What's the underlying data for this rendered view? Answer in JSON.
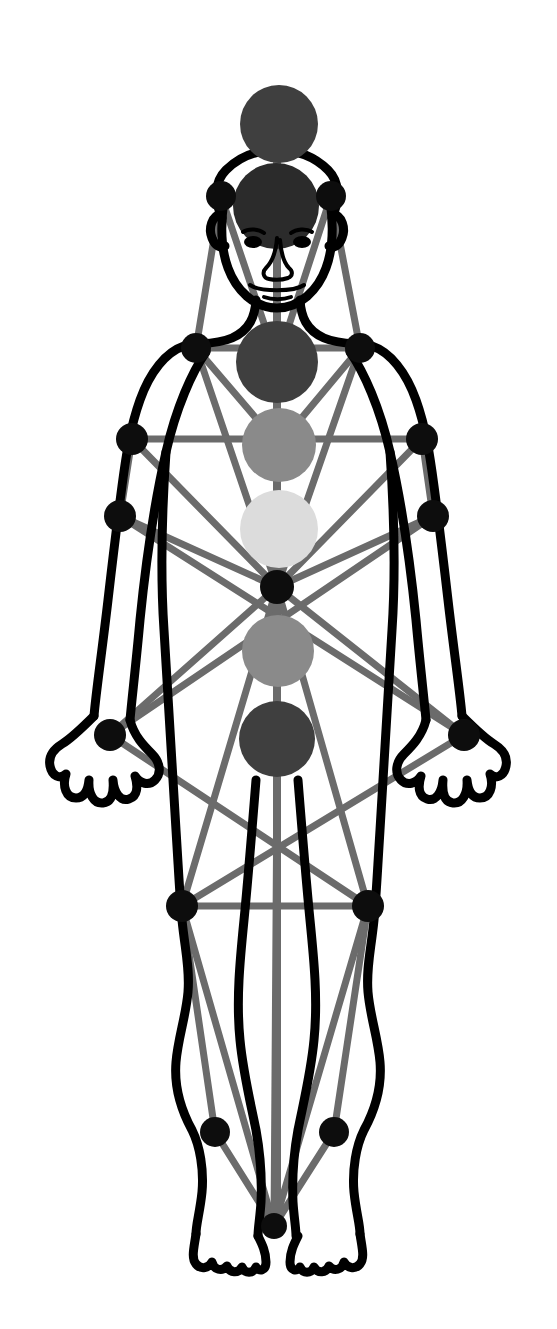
{
  "diagram": {
    "title": "Tree of Life overlaid on human body",
    "type": "anatomical-overlay-diagram",
    "canvas": {
      "width": 557,
      "height": 1329
    },
    "background_color": "#ffffff",
    "body_outline_color": "#000000",
    "path_color": "#6b6b6b",
    "node_color": "#0d0d0d"
  },
  "palette": {
    "body_stroke": "#000000",
    "connector": "#6b6b6b",
    "connector_light": "#7d7d7d",
    "node_black": "#0d0d0d",
    "circle_dark": "#3f3f3f",
    "circle_darker": "#2b2b2b",
    "circle_mid": "#8a8a8a",
    "circle_light": "#dcdcdc",
    "white": "#ffffff"
  },
  "center_circles": [
    {
      "name": "crown-circle",
      "label": "Crown",
      "cx": 279,
      "cy": 124,
      "r": 39,
      "color": "#3f3f3f"
    },
    {
      "name": "head-circle",
      "label": "Head",
      "cx": 276,
      "cy": 206,
      "r": 43,
      "color": "#2b2b2b"
    },
    {
      "name": "throat-chest-circle",
      "label": "Throat/Chest",
      "cx": 277,
      "cy": 362,
      "r": 41,
      "color": "#3f3f3f"
    },
    {
      "name": "heart-circle",
      "label": "Heart",
      "cx": 279,
      "cy": 445,
      "r": 37,
      "color": "#8a8a8a"
    },
    {
      "name": "solar-plexus-circle",
      "label": "Solar Plexus",
      "cx": 279,
      "cy": 529,
      "r": 39,
      "color": "#dcdcdc"
    },
    {
      "name": "sacral-circle",
      "label": "Sacral",
      "cx": 278,
      "cy": 651,
      "r": 36,
      "color": "#8a8a8a"
    },
    {
      "name": "root-circle",
      "label": "Root",
      "cx": 277,
      "cy": 739,
      "r": 38,
      "color": "#3f3f3f"
    }
  ],
  "nodes": [
    {
      "name": "node-temple-left",
      "label": "Left Temple",
      "cx": 221,
      "cy": 196,
      "r": 15
    },
    {
      "name": "node-temple-right",
      "label": "Right Temple",
      "cx": 331,
      "cy": 196,
      "r": 15
    },
    {
      "name": "node-shoulder-left",
      "label": "Left Shoulder",
      "cx": 196,
      "cy": 348,
      "r": 15
    },
    {
      "name": "node-shoulder-right",
      "label": "Right Shoulder",
      "cx": 360,
      "cy": 348,
      "r": 15
    },
    {
      "name": "node-elbow-left",
      "label": "Left Elbow",
      "cx": 132,
      "cy": 439,
      "r": 16
    },
    {
      "name": "node-elbow-right",
      "label": "Right Elbow",
      "cx": 422,
      "cy": 439,
      "r": 16
    },
    {
      "name": "node-forearm-left",
      "label": "Left Forearm",
      "cx": 120,
      "cy": 516,
      "r": 16
    },
    {
      "name": "node-forearm-right",
      "label": "Right Forearm",
      "cx": 433,
      "cy": 516,
      "r": 16
    },
    {
      "name": "node-center",
      "label": "Center",
      "cx": 277,
      "cy": 587,
      "r": 17
    },
    {
      "name": "node-hand-left",
      "label": "Left Hand",
      "cx": 110,
      "cy": 735,
      "r": 16
    },
    {
      "name": "node-hand-right",
      "label": "Right Hand",
      "cx": 464,
      "cy": 735,
      "r": 16
    },
    {
      "name": "node-knee-left",
      "label": "Left Knee",
      "cx": 182,
      "cy": 906,
      "r": 16
    },
    {
      "name": "node-knee-right",
      "label": "Right Knee",
      "cx": 368,
      "cy": 906,
      "r": 16
    },
    {
      "name": "node-ankle-left",
      "label": "Left Ankle",
      "cx": 215,
      "cy": 1132,
      "r": 15
    },
    {
      "name": "node-ankle-right",
      "label": "Right Ankle",
      "cx": 334,
      "cy": 1132,
      "r": 15
    },
    {
      "name": "node-feet",
      "label": "Feet",
      "cx": 274,
      "cy": 1226,
      "r": 13
    }
  ],
  "connectors": [
    {
      "name": "conn-temple-left-to-temple-right",
      "x1": 221,
      "y1": 196,
      "x2": 331,
      "y2": 196
    },
    {
      "name": "conn-temple-left-to-shoulder-left",
      "x1": 221,
      "y1": 196,
      "x2": 196,
      "y2": 348
    },
    {
      "name": "conn-temple-right-to-shoulder-right",
      "x1": 331,
      "y1": 196,
      "x2": 360,
      "y2": 348
    },
    {
      "name": "conn-temple-left-to-head-circle",
      "x1": 221,
      "y1": 196,
      "x2": 277,
      "y2": 362
    },
    {
      "name": "conn-temple-right-to-head-circle",
      "x1": 331,
      "y1": 196,
      "x2": 277,
      "y2": 362
    },
    {
      "name": "conn-shoulder-left-to-shoulder-right",
      "x1": 196,
      "y1": 348,
      "x2": 360,
      "y2": 348
    },
    {
      "name": "conn-shoulder-left-to-heart",
      "x1": 196,
      "y1": 348,
      "x2": 279,
      "y2": 445
    },
    {
      "name": "conn-shoulder-right-to-heart",
      "x1": 360,
      "y1": 348,
      "x2": 279,
      "y2": 445
    },
    {
      "name": "conn-shoulder-left-to-center",
      "x1": 196,
      "y1": 348,
      "x2": 277,
      "y2": 587
    },
    {
      "name": "conn-shoulder-right-to-center",
      "x1": 360,
      "y1": 348,
      "x2": 277,
      "y2": 587
    },
    {
      "name": "conn-elbow-left-to-elbow-right",
      "x1": 132,
      "y1": 439,
      "x2": 422,
      "y2": 439
    },
    {
      "name": "conn-elbow-left-to-forearm-left",
      "x1": 132,
      "y1": 439,
      "x2": 120,
      "y2": 516
    },
    {
      "name": "conn-elbow-right-to-forearm-right",
      "x1": 422,
      "y1": 439,
      "x2": 433,
      "y2": 516
    },
    {
      "name": "conn-elbow-left-to-center",
      "x1": 132,
      "y1": 439,
      "x2": 277,
      "y2": 587
    },
    {
      "name": "conn-elbow-right-to-center",
      "x1": 422,
      "y1": 439,
      "x2": 277,
      "y2": 587
    },
    {
      "name": "conn-forearm-left-to-hand-right",
      "x1": 120,
      "y1": 516,
      "x2": 464,
      "y2": 735
    },
    {
      "name": "conn-forearm-right-to-hand-left",
      "x1": 433,
      "y1": 516,
      "x2": 110,
      "y2": 735
    },
    {
      "name": "conn-forearm-left-to-center",
      "x1": 120,
      "y1": 516,
      "x2": 277,
      "y2": 587
    },
    {
      "name": "conn-forearm-right-to-center",
      "x1": 433,
      "y1": 516,
      "x2": 277,
      "y2": 587
    },
    {
      "name": "conn-center-to-hand-left",
      "x1": 277,
      "y1": 587,
      "x2": 110,
      "y2": 735
    },
    {
      "name": "conn-center-to-hand-right",
      "x1": 277,
      "y1": 587,
      "x2": 464,
      "y2": 735
    },
    {
      "name": "conn-center-to-knee-left",
      "x1": 277,
      "y1": 587,
      "x2": 182,
      "y2": 906
    },
    {
      "name": "conn-center-to-knee-right",
      "x1": 277,
      "y1": 587,
      "x2": 368,
      "y2": 906
    },
    {
      "name": "conn-hand-left-to-knee-right",
      "x1": 110,
      "y1": 735,
      "x2": 368,
      "y2": 906
    },
    {
      "name": "conn-hand-right-to-knee-left",
      "x1": 464,
      "y1": 735,
      "x2": 182,
      "y2": 906
    },
    {
      "name": "conn-knee-left-to-knee-right",
      "x1": 182,
      "y1": 906,
      "x2": 368,
      "y2": 906
    },
    {
      "name": "conn-knee-left-to-ankle-left",
      "x1": 182,
      "y1": 906,
      "x2": 215,
      "y2": 1132
    },
    {
      "name": "conn-knee-right-to-ankle-right",
      "x1": 368,
      "y1": 906,
      "x2": 334,
      "y2": 1132
    },
    {
      "name": "conn-knee-left-to-feet",
      "x1": 182,
      "y1": 906,
      "x2": 274,
      "y2": 1226
    },
    {
      "name": "conn-knee-right-to-feet",
      "x1": 368,
      "y1": 906,
      "x2": 274,
      "y2": 1226
    },
    {
      "name": "conn-ankle-left-to-feet",
      "x1": 215,
      "y1": 1132,
      "x2": 274,
      "y2": 1226
    },
    {
      "name": "conn-ankle-right-to-feet",
      "x1": 334,
      "y1": 1132,
      "x2": 274,
      "y2": 1226
    },
    {
      "name": "conn-center-axis-to-feet",
      "x1": 277,
      "y1": 777,
      "x2": 274,
      "y2": 1226
    }
  ],
  "center_axis": {
    "name": "central-pillar",
    "label": "Central Pillar",
    "x": 277,
    "from_y": 163,
    "to_y": 1226
  }
}
